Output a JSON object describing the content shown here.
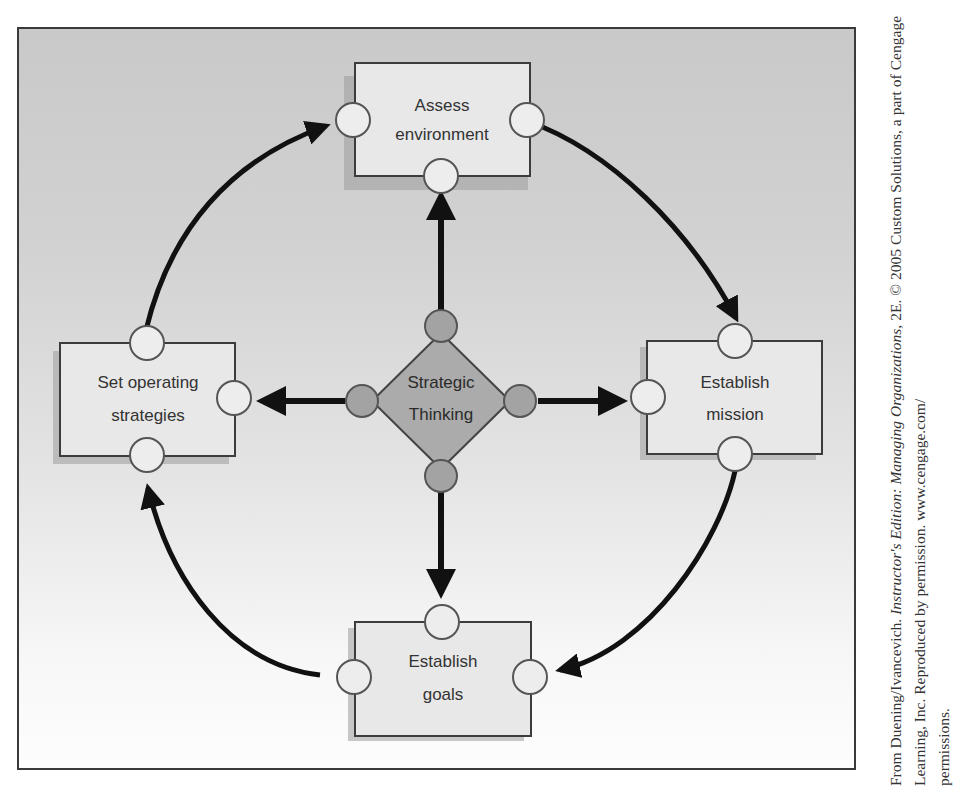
{
  "diagram": {
    "center": {
      "line1": "Strategic",
      "line2": "Thinking",
      "fill": "#a8a8a8"
    },
    "nodes": [
      {
        "id": "assess-environment",
        "line1": "Assess",
        "line2": "environment",
        "position": "top"
      },
      {
        "id": "establish-mission",
        "line1": "Establish",
        "line2": "mission",
        "position": "right"
      },
      {
        "id": "establish-goals",
        "line1": "Establish",
        "line2": "goals",
        "position": "bottom"
      },
      {
        "id": "set-operating-strategies",
        "line1": "Set operating",
        "line2": "strategies",
        "position": "left"
      }
    ],
    "cycle_order": [
      "Assess environment",
      "Establish mission",
      "Establish goals",
      "Set operating strategies"
    ],
    "colors": {
      "box_fill": "#e6e6e6",
      "box_border": "#3c3c3c",
      "connector_fill": "#ededed",
      "arrow": "#111111"
    }
  },
  "credit": {
    "prefix": "From Duening/Ivancevich. ",
    "title_italic": "Instructor's Edition: Managing Organizations",
    "suffix": ", 2E. © 2005 Custom Solutions, a part of Cengage Learning, Inc. Reproduced by permission. www.cengage.com/",
    "last_line": "permissions."
  }
}
